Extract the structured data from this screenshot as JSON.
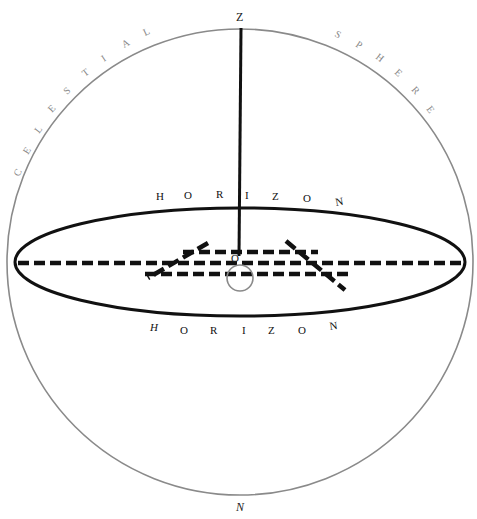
{
  "diagram": {
    "arc_label_left": [
      "C",
      "E",
      "L",
      "E",
      "S",
      "T",
      "I",
      "A",
      "L"
    ],
    "arc_label_right": [
      "S",
      "P",
      "H",
      "E",
      "R",
      "E"
    ],
    "zenith_label": "Z",
    "nadir_label": "N",
    "observer_label": "O",
    "horizon_upper": [
      "H",
      "O",
      "R",
      "I",
      "Z",
      "O",
      "N"
    ],
    "horizon_lower": [
      "H",
      "O",
      "R",
      "I",
      "Z",
      "O",
      "N"
    ],
    "colors": {
      "sphere_stroke": "#8a8a8a",
      "horizon_stroke": "#111111",
      "text": "#222222",
      "background": "#ffffff"
    }
  }
}
